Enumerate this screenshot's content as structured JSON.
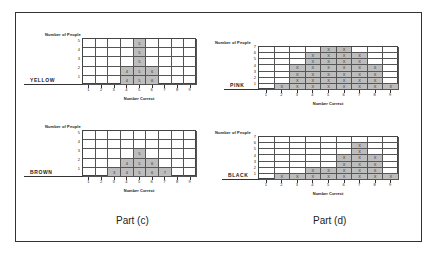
{
  "parts": [
    {
      "label": "Part (c)"
    },
    {
      "label": "Part (d)"
    }
  ],
  "chart_data": [
    {
      "type": "bar",
      "subtype": "dot-plot / tally grid",
      "part": "Part (c)",
      "series_name": "YELLOW",
      "ylabel": "Number of People",
      "xlabel": "Number Correct",
      "categories": [
        1,
        2,
        3,
        4,
        5,
        6,
        7,
        8,
        9
      ],
      "values": [
        0,
        0,
        0,
        2,
        5,
        2,
        0,
        0,
        0
      ],
      "cell_mark": "number correct digit",
      "yticks": [
        1,
        2,
        3,
        4,
        5
      ],
      "ylim": [
        0,
        5
      ],
      "grid": true
    },
    {
      "type": "bar",
      "subtype": "dot-plot / tally grid",
      "part": "Part (c)",
      "series_name": "BROWN",
      "ylabel": "Number of People",
      "xlabel": "Number Correct",
      "categories": [
        1,
        2,
        3,
        4,
        5,
        6,
        7,
        8,
        9
      ],
      "values": [
        0,
        0,
        1,
        2,
        3,
        2,
        1,
        0,
        0
      ],
      "cell_mark": "number correct digit",
      "yticks": [
        1,
        2,
        3,
        4,
        5
      ],
      "ylim": [
        0,
        5
      ],
      "grid": true
    },
    {
      "type": "bar",
      "subtype": "dot-plot / tally grid",
      "part": "Part (d)",
      "series_name": "PINK",
      "ylabel": "Number of People",
      "xlabel": "Number Correct",
      "categories": [
        1,
        2,
        3,
        4,
        5,
        6,
        7,
        8,
        9
      ],
      "values": [
        0,
        1,
        4,
        6,
        7,
        7,
        6,
        4,
        1
      ],
      "cell_mark": "X",
      "yticks": [
        1,
        2,
        3,
        4,
        5,
        6,
        7
      ],
      "ylim": [
        0,
        7
      ],
      "grid": true
    },
    {
      "type": "bar",
      "subtype": "dot-plot / tally grid",
      "part": "Part (d)",
      "series_name": "BLACK",
      "ylabel": "Number of People",
      "xlabel": "Number Correct",
      "categories": [
        1,
        2,
        3,
        4,
        5,
        6,
        7,
        8,
        9
      ],
      "values": [
        0,
        1,
        1,
        2,
        2,
        4,
        6,
        4,
        1
      ],
      "cell_mark": "X",
      "yticks": [
        1,
        2,
        3,
        4,
        5,
        6,
        7
      ],
      "ylim": [
        0,
        7
      ],
      "grid": true
    }
  ],
  "layout": [
    {
      "left": 82,
      "top": 38,
      "width": 114,
      "height": 46,
      "name_x": 30,
      "ylabel_x": 45
    },
    {
      "left": 82,
      "top": 130,
      "width": 114,
      "height": 46,
      "name_x": 30,
      "ylabel_x": 45
    },
    {
      "left": 258,
      "top": 46,
      "width": 140,
      "height": 43,
      "name_x": 230,
      "ylabel_x": 215
    },
    {
      "left": 258,
      "top": 136,
      "width": 140,
      "height": 43,
      "name_x": 228,
      "ylabel_x": 215
    }
  ],
  "colors": {
    "fill": "#bdbdbd",
    "line": "#444444",
    "text": "#222222"
  }
}
